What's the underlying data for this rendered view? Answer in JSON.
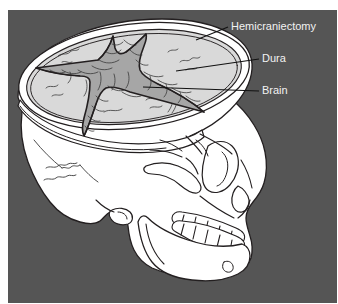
{
  "figure": {
    "title": "Hemicraniectomy",
    "background_color": "#555555",
    "outer_margin_color": "#ffffff",
    "line_color": "#231f20",
    "bone_fill": "#ffffff",
    "dura_fill": "#d9d9d9",
    "brain_fill": "#a6a6a6",
    "label_color": "#f2f2f2",
    "leader_line_color": "#1a1a1a"
  },
  "labels": [
    {
      "id": "hemicraniectomy",
      "text": "Hemicraniectomy",
      "x": 231,
      "y": 27,
      "leader": {
        "x1": 228,
        "y1": 27,
        "x2": 196,
        "y2": 40
      }
    },
    {
      "id": "dura",
      "text": "Dura",
      "x": 262,
      "y": 59,
      "leader": {
        "x1": 259,
        "y1": 59,
        "x2": 176,
        "y2": 71
      }
    },
    {
      "id": "brain",
      "text": "Brain",
      "x": 262,
      "y": 91,
      "leader": {
        "x1": 259,
        "y1": 91,
        "x2": 143,
        "y2": 87
      }
    }
  ],
  "anatomy": {
    "parts": [
      {
        "id": "cranium",
        "name": "Cranial vault"
      },
      {
        "id": "craniectomy-rim",
        "name": "Craniectomy bone edge"
      },
      {
        "id": "dura-mater",
        "name": "Dura mater"
      },
      {
        "id": "brain-surface",
        "name": "Brain surface (gyri)"
      },
      {
        "id": "dural-incision",
        "name": "Cruciate dural incision"
      },
      {
        "id": "orbit",
        "name": "Orbital socket"
      },
      {
        "id": "zygomatic-arch",
        "name": "Zygomatic arch"
      },
      {
        "id": "nasal-aperture",
        "name": "Nasal aperture"
      },
      {
        "id": "maxilla-teeth",
        "name": "Upper dental arch"
      },
      {
        "id": "mandible-teeth",
        "name": "Lower dental arch"
      },
      {
        "id": "mandible",
        "name": "Mandible"
      },
      {
        "id": "occipital-suture",
        "name": "Lambdoid suture"
      }
    ]
  }
}
